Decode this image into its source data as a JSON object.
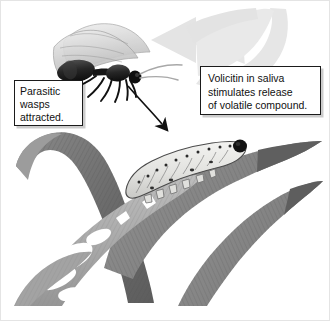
{
  "figure": {
    "background_color": "#ffffff",
    "border_color": "#e4e4e4",
    "width": 330,
    "height": 321
  },
  "callouts": [
    {
      "id": "wasp",
      "lines": [
        "Parasitic",
        "wasps",
        "attracted."
      ],
      "text": "Parasitic wasps attracted.",
      "border_color": "#1b1b1b",
      "background_color": "#ffffff",
      "text_color": "#111111"
    },
    {
      "id": "volicitin",
      "lines": [
        "Volicitin in saliva",
        "stimulates release",
        "of volatile compound."
      ],
      "text": "Volicitin in saliva stimulates release of volatile compound.",
      "border_color": "#1b1b1b",
      "background_color": "#ffffff",
      "text_color": "#111111"
    }
  ],
  "illustration": {
    "wasp": {
      "label": "parasitic wasp",
      "body_color": "#1a1a1a",
      "wing_color": "#cfcfcf"
    },
    "caterpillar": {
      "label": "caterpillar larva feeding on leaf",
      "body_color": "#e8e8e6",
      "outline_color": "#4a4a4a",
      "head_color": "#121212"
    },
    "volatile_arrow": {
      "label": "volatile compound plume arrow",
      "color": "#e2e2e2",
      "direction": "curves from leaf up and over to upper left"
    },
    "attraction_arrow": {
      "label": "wasp attracted to caterpillar arrow",
      "color": "#111111",
      "direction": "curves from wasp head down to caterpillar"
    },
    "leaves": [
      {
        "id": "leaf-dark-left",
        "color": "#6f6f6f",
        "label": "dark maize leaf arching from upper left"
      },
      {
        "id": "leaf-light-diagonal",
        "color": "#a9a9a9",
        "label": "light chewed maize leaf crossing diagonally"
      },
      {
        "id": "leaf-dark-right",
        "color": "#7a7a7a",
        "label": "dark maize leaf under caterpillar"
      },
      {
        "id": "leaf-lower-right",
        "color": "#8a8a8a",
        "label": "lower right maize leaf"
      },
      {
        "id": "leaf-lower-left",
        "color": "#9b9b9b",
        "label": "lower left maize leaf blade"
      }
    ]
  }
}
